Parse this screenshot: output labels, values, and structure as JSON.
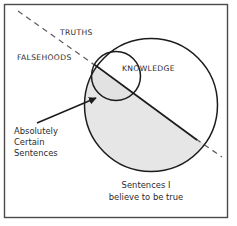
{
  "diagram": {
    "frame": {
      "border_color": "#4a4a4a",
      "background_color": "#ffffff"
    },
    "colors": {
      "stroke": "#1c1c1c",
      "shaded_region_fill": "#e6e6e6",
      "text": "#2b2b2b",
      "dashed_line": "#6f6f6f"
    },
    "labels": {
      "truths": "TRUTHS",
      "falsehoods": "FALSEHOODS",
      "knowledge": "KNOWLEDGE",
      "absolutely_certain_line1": "Absolutely",
      "absolutely_certain_line2": "Certain",
      "absolutely_certain_line3": "Sentences",
      "believed_line1": "Sentences I",
      "believed_line2": "believe to be true"
    },
    "regions": [
      {
        "name": "truths",
        "label": "TRUTHS",
        "description": "Area above and right of the dashed dividing line"
      },
      {
        "name": "falsehoods",
        "label": "FALSEHOODS",
        "description": "Area below and left of the dashed dividing line"
      },
      {
        "name": "knowledge",
        "label": "KNOWLEDGE",
        "description": "Small circle overlapping the upper-left of the belief circle"
      },
      {
        "name": "believed-sentences",
        "label": "Sentences I believe to be true",
        "description": "Large circle"
      },
      {
        "name": "absolutely-certain-sentences",
        "label": "Absolutely Certain Sentences",
        "description": "Shaded lens where knowledge circle meets falsehood side of belief circle"
      }
    ],
    "annotations": {
      "arrow": {
        "name": "pointer-arrow",
        "from": "Absolutely Certain Sentences label",
        "to": "shaded lens region"
      },
      "divider": {
        "name": "truth-falsehood-divider",
        "style": "dashed"
      }
    }
  }
}
